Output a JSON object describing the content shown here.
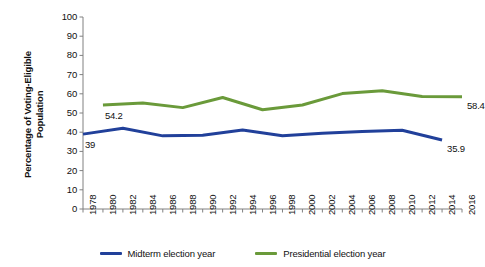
{
  "chart_data": {
    "type": "line",
    "title": "",
    "xlabel": "",
    "ylabel": "Percentage of Voting-Eligible Population",
    "ylim": [
      0,
      100
    ],
    "ytick_step": 10,
    "yticks": [
      "100",
      "90",
      "80",
      "70",
      "60",
      "50",
      "40",
      "30",
      "20",
      "10",
      "0"
    ],
    "xlim": [
      1978,
      2016
    ],
    "xticks": [
      "1978",
      "1980",
      "1982",
      "1984",
      "1986",
      "1988",
      "1990",
      "1992",
      "1994",
      "1996",
      "1998",
      "2000",
      "2002",
      "2004",
      "2006",
      "2008",
      "2010",
      "2012",
      "2014",
      "2016"
    ],
    "grid": false,
    "legend_position": "bottom",
    "series": [
      {
        "name": "Midterm election year",
        "color": "#21409A",
        "x": [
          1978,
          1982,
          1986,
          1990,
          1994,
          1998,
          2002,
          2006,
          2010,
          2014
        ],
        "values": [
          39.0,
          42.1,
          38.1,
          38.4,
          41.1,
          38.1,
          39.5,
          40.4,
          41.0,
          35.9
        ]
      },
      {
        "name": "Presidential election year",
        "color": "#6A9A3A",
        "x": [
          1980,
          1984,
          1988,
          1992,
          1996,
          2000,
          2004,
          2008,
          2012,
          2016
        ],
        "values": [
          54.2,
          55.2,
          52.8,
          58.1,
          51.7,
          54.2,
          60.1,
          61.6,
          58.6,
          58.4
        ]
      }
    ],
    "annotations": [
      {
        "text": "39",
        "series": "Midterm election year",
        "x": 1978,
        "value": 39.0
      },
      {
        "text": "35.9",
        "series": "Midterm election year",
        "x": 2014,
        "value": 35.9
      },
      {
        "text": "54.2",
        "series": "Presidential election year",
        "x": 1980,
        "value": 54.2
      },
      {
        "text": "58.4",
        "series": "Presidential election year",
        "x": 2016,
        "value": 58.4
      }
    ]
  },
  "legend": {
    "items": [
      {
        "label": "Midterm election year",
        "color": "#21409A"
      },
      {
        "label": "Presidential election year",
        "color": "#6A9A3A"
      }
    ]
  },
  "axis": {
    "y_title_line1": "Percentage of Voting-Eligible",
    "y_title_line2": "Population"
  }
}
